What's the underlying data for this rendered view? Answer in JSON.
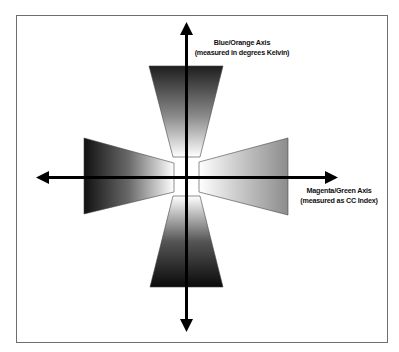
{
  "diagram": {
    "vertical_axis": {
      "line1": "Blue/Orange Axis",
      "line2": "(measured in degrees Kelvin)"
    },
    "horizontal_axis": {
      "line1": "Magenta/Green Axis",
      "line2": "(measured as CC  Index)"
    },
    "colors": {
      "frame": "#6e6e6e",
      "axis": "#000000",
      "dark_end": "#1a1a1a",
      "light_end": "#ffffff",
      "mid_gray": "#8a8a8a"
    },
    "wedges": [
      {
        "name": "top-wedge",
        "direction": "up",
        "gradient": "dark-to-light toward center"
      },
      {
        "name": "bottom-wedge",
        "direction": "down",
        "gradient": "dark-to-light toward center"
      },
      {
        "name": "left-wedge",
        "direction": "left",
        "gradient": "dark-to-light toward center"
      },
      {
        "name": "right-wedge",
        "direction": "right",
        "gradient": "gray-to-light toward center"
      }
    ]
  }
}
